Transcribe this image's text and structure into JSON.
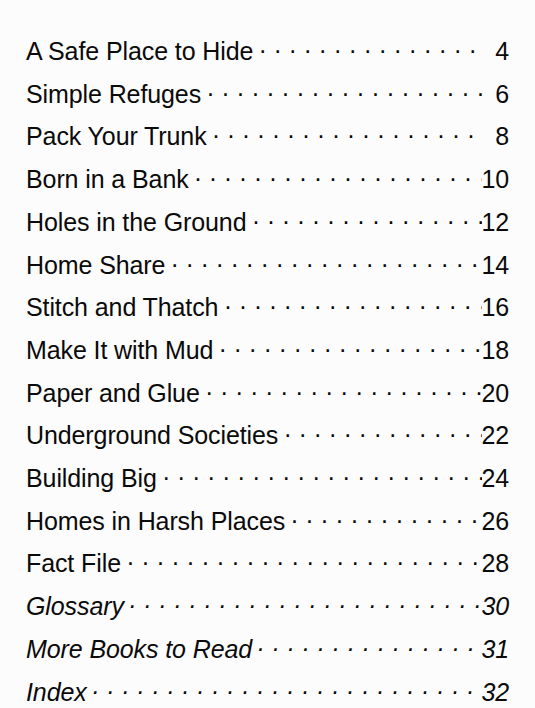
{
  "page": {
    "kind": "table-of-contents",
    "background_color": "#fcfcfc",
    "text_color": "#0a0a0a",
    "leader_character": "."
  },
  "contents": {
    "entries": [
      {
        "title": "A Safe Place to Hide",
        "page": "4",
        "style": "regular"
      },
      {
        "title": "Simple Refuges",
        "page": "6",
        "style": "regular"
      },
      {
        "title": "Pack Your Trunk",
        "page": "8",
        "style": "regular"
      },
      {
        "title": "Born in a Bank",
        "page": "10",
        "style": "regular"
      },
      {
        "title": "Holes in the Ground",
        "page": "12",
        "style": "regular"
      },
      {
        "title": "Home Share",
        "page": "14",
        "style": "regular"
      },
      {
        "title": "Stitch and Thatch",
        "page": "16",
        "style": "regular"
      },
      {
        "title": "Make It with Mud",
        "page": "18",
        "style": "regular"
      },
      {
        "title": "Paper and Glue",
        "page": "20",
        "style": "regular"
      },
      {
        "title": "Underground Societies",
        "page": "22",
        "style": "regular"
      },
      {
        "title": "Building Big",
        "page": "24",
        "style": "regular"
      },
      {
        "title": "Homes in Harsh Places",
        "page": "26",
        "style": "regular"
      },
      {
        "title": "Fact File",
        "page": "28",
        "style": "regular"
      },
      {
        "title": "Glossary",
        "page": "30",
        "style": "italic"
      },
      {
        "title": "More Books to Read",
        "page": "31",
        "style": "italic"
      },
      {
        "title": "Index",
        "page": "32",
        "style": "italic"
      }
    ]
  }
}
